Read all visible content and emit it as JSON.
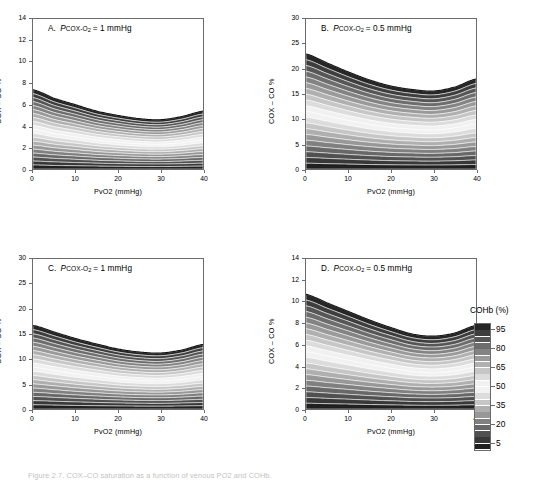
{
  "figure": {
    "caption": "Figure 2.7.  COX–CO saturation as a function of venous PO2 and COHb."
  },
  "axes": {
    "xlabel": "PvO2 (mmHg)",
    "ylabel": "COX – CO %",
    "xticks": [
      "0",
      "10",
      "20",
      "30",
      "40"
    ],
    "xlim": [
      0,
      40
    ]
  },
  "legend": {
    "title": "COHb (%)",
    "labels": [
      "95",
      "80",
      "65",
      "50",
      "35",
      "20",
      "5"
    ],
    "range": [
      0,
      100
    ],
    "position": "right"
  },
  "panels": [
    {
      "id": "A",
      "letter": "A.",
      "param_symbol": "P",
      "param_sub": "COX-O",
      "param_sub2": "2",
      "param_value": "= 1 mmHg",
      "yticks": [
        "0",
        "2",
        "4",
        "6",
        "8",
        "10",
        "12",
        "14"
      ],
      "ylim": [
        0,
        14
      ],
      "peak_left": 7.4,
      "peak_right": 5.4,
      "peak_min": 4.6
    },
    {
      "id": "B",
      "letter": "B.",
      "param_symbol": "P",
      "param_sub": "COX-O",
      "param_sub2": "2",
      "param_value": "= 0.5 mmHg",
      "yticks": [
        "0",
        "5",
        "10",
        "15",
        "20",
        "25",
        "30"
      ],
      "ylim": [
        0,
        30
      ],
      "peak_left": 23.0,
      "peak_right": 18.0,
      "peak_min": 15.6
    },
    {
      "id": "C",
      "letter": "C.",
      "param_symbol": "P",
      "param_sub": "COX-O",
      "param_sub2": "2",
      "param_value": "= 1 mmHg",
      "yticks": [
        "0",
        "5",
        "10",
        "15",
        "20",
        "25",
        "30"
      ],
      "ylim": [
        0,
        30
      ],
      "peak_left": 16.7,
      "peak_right": 12.9,
      "peak_min": 11.2
    },
    {
      "id": "D",
      "letter": "D.",
      "param_symbol": "P",
      "param_sub": "COX-O",
      "param_sub2": "2",
      "param_value": "= 0.5 mmHg",
      "yticks": [
        "0",
        "2",
        "4",
        "6",
        "8",
        "10",
        "12",
        "14"
      ],
      "ylim": [
        0,
        14
      ],
      "peak_left": 10.7,
      "peak_right": 7.8,
      "peak_min": 6.8
    }
  ],
  "chart_data": {
    "type": "area",
    "xlabel": "PvO2 (mmHg)",
    "ylabel": "COX – CO %",
    "x": [
      0,
      5,
      10,
      15,
      20,
      25,
      30,
      35,
      40
    ],
    "grid": false,
    "legend": "COHb (%)",
    "contour_levels": [
      5,
      10,
      15,
      20,
      25,
      30,
      35,
      40,
      45,
      50,
      55,
      60,
      65,
      70,
      75,
      80,
      85,
      90,
      95,
      100
    ],
    "panels": [
      {
        "id": "A",
        "label": "A. PCOX-O2 = 1 mmHg",
        "ylim": [
          0,
          14
        ],
        "envelope_top": [
          7.4,
          6.6,
          6.0,
          5.4,
          5.0,
          4.7,
          4.6,
          4.9,
          5.4
        ]
      },
      {
        "id": "B",
        "label": "B. PCOX-O2 = 0.5 mmHg",
        "ylim": [
          0,
          30
        ],
        "envelope_top": [
          23.0,
          21.2,
          19.4,
          17.8,
          16.6,
          15.9,
          15.6,
          16.4,
          18.0
        ]
      },
      {
        "id": "C",
        "label": "C. PCOX-O2 = 1 mmHg",
        "ylim": [
          0,
          30
        ],
        "envelope_top": [
          16.7,
          15.4,
          14.1,
          13.0,
          12.0,
          11.4,
          11.2,
          11.8,
          12.9
        ]
      },
      {
        "id": "D",
        "label": "D. PCOX-O2 = 0.5 mmHg",
        "ylim": [
          0,
          14
        ],
        "envelope_top": [
          10.7,
          9.9,
          9.1,
          8.3,
          7.6,
          7.0,
          6.8,
          7.1,
          7.8
        ]
      }
    ]
  }
}
